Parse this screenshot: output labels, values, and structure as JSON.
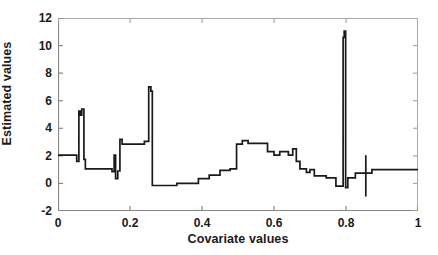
{
  "chart_data": {
    "type": "line",
    "title": "",
    "xlabel": "Covariate values",
    "ylabel": "Estimated values",
    "xlim": [
      0,
      1
    ],
    "ylim": [
      -2,
      12
    ],
    "xticks": [
      0,
      0.2,
      0.4,
      0.6,
      0.8,
      1
    ],
    "xticklabels": [
      "0",
      "0.2",
      "0.4",
      "0.6",
      "0.8",
      "1"
    ],
    "yticks": [
      -2,
      0,
      2,
      4,
      6,
      8,
      10,
      12
    ],
    "yticklabels": [
      "-2",
      "0",
      "2",
      "4",
      "6",
      "8",
      "10",
      "12"
    ],
    "grid": false,
    "legend": "none",
    "line_color": "#1a1a1a",
    "series": [
      {
        "name": "estimate",
        "description": "Piecewise-constant step function with narrow spikes; vertical segments are jumps between levels.",
        "points": [
          [
            0.0,
            2.05
          ],
          [
            0.052,
            2.05
          ],
          [
            0.052,
            1.6
          ],
          [
            0.058,
            1.6
          ],
          [
            0.058,
            5.25
          ],
          [
            0.062,
            5.25
          ],
          [
            0.062,
            4.95
          ],
          [
            0.066,
            4.95
          ],
          [
            0.066,
            5.4
          ],
          [
            0.072,
            5.4
          ],
          [
            0.072,
            1.75
          ],
          [
            0.076,
            1.75
          ],
          [
            0.076,
            1.05
          ],
          [
            0.15,
            1.05
          ],
          [
            0.15,
            0.85
          ],
          [
            0.156,
            0.85
          ],
          [
            0.156,
            2.05
          ],
          [
            0.16,
            2.05
          ],
          [
            0.16,
            0.35
          ],
          [
            0.166,
            0.35
          ],
          [
            0.166,
            0.9
          ],
          [
            0.172,
            0.9
          ],
          [
            0.172,
            3.2
          ],
          [
            0.178,
            3.2
          ],
          [
            0.178,
            2.85
          ],
          [
            0.24,
            2.85
          ],
          [
            0.24,
            3.05
          ],
          [
            0.252,
            3.05
          ],
          [
            0.252,
            7.0
          ],
          [
            0.258,
            7.0
          ],
          [
            0.258,
            6.7
          ],
          [
            0.262,
            6.7
          ],
          [
            0.262,
            -0.15
          ],
          [
            0.33,
            -0.15
          ],
          [
            0.33,
            0.0
          ],
          [
            0.39,
            0.0
          ],
          [
            0.39,
            0.35
          ],
          [
            0.42,
            0.35
          ],
          [
            0.42,
            0.6
          ],
          [
            0.45,
            0.6
          ],
          [
            0.45,
            0.95
          ],
          [
            0.478,
            0.95
          ],
          [
            0.478,
            1.05
          ],
          [
            0.496,
            1.05
          ],
          [
            0.496,
            2.85
          ],
          [
            0.512,
            2.85
          ],
          [
            0.512,
            3.1
          ],
          [
            0.528,
            3.1
          ],
          [
            0.528,
            2.9
          ],
          [
            0.582,
            2.9
          ],
          [
            0.582,
            2.3
          ],
          [
            0.6,
            2.3
          ],
          [
            0.6,
            2.05
          ],
          [
            0.616,
            2.05
          ],
          [
            0.616,
            2.3
          ],
          [
            0.64,
            2.3
          ],
          [
            0.64,
            2.05
          ],
          [
            0.652,
            2.05
          ],
          [
            0.652,
            2.5
          ],
          [
            0.662,
            2.5
          ],
          [
            0.662,
            1.6
          ],
          [
            0.672,
            1.6
          ],
          [
            0.672,
            1.05
          ],
          [
            0.69,
            1.05
          ],
          [
            0.69,
            0.8
          ],
          [
            0.7,
            0.8
          ],
          [
            0.7,
            1.0
          ],
          [
            0.712,
            1.0
          ],
          [
            0.712,
            0.55
          ],
          [
            0.745,
            0.55
          ],
          [
            0.745,
            0.4
          ],
          [
            0.772,
            0.4
          ],
          [
            0.772,
            -0.2
          ],
          [
            0.792,
            -0.2
          ],
          [
            0.792,
            10.6
          ],
          [
            0.795,
            10.6
          ],
          [
            0.795,
            11.05
          ],
          [
            0.799,
            11.05
          ],
          [
            0.799,
            -0.3
          ],
          [
            0.805,
            -0.3
          ],
          [
            0.805,
            0.4
          ],
          [
            0.826,
            0.4
          ],
          [
            0.826,
            0.75
          ],
          [
            0.872,
            0.75
          ],
          [
            0.872,
            1.0
          ],
          [
            1.0,
            1.0
          ]
        ],
        "vertical_markers": [
          {
            "x": 0.855,
            "y_low": -0.95,
            "y_high": 2.05
          }
        ]
      }
    ]
  },
  "axes": {
    "x_axis_name": "covariate-axis",
    "y_axis_name": "estimated-values-axis"
  }
}
